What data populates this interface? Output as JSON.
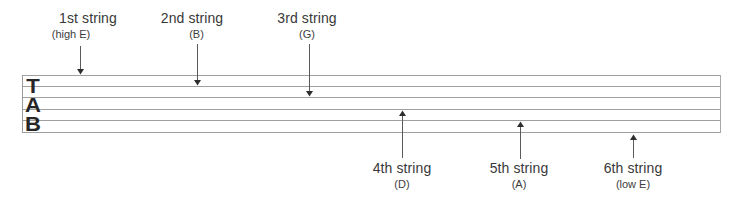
{
  "diagram": {
    "type": "guitar-tablature-string-guide",
    "clef": {
      "letters": [
        "T",
        "A",
        "B"
      ]
    },
    "colors": {
      "staff_line": "#a0a0a0",
      "text": "#383838",
      "arrow": "#3a3a3a",
      "clef": "#262626",
      "background": "#ffffff"
    },
    "strings": [
      {
        "number": 1,
        "label": "1st string",
        "note": "(high E)",
        "position": "top"
      },
      {
        "number": 2,
        "label": "2nd string",
        "note": "(B)",
        "position": "top"
      },
      {
        "number": 3,
        "label": "3rd string",
        "note": "(G)",
        "position": "top"
      },
      {
        "number": 4,
        "label": "4th string",
        "note": "(D)",
        "position": "bottom"
      },
      {
        "number": 5,
        "label": "5th string",
        "note": "(A)",
        "position": "bottom"
      },
      {
        "number": 6,
        "label": "6th string",
        "note": "(low E)",
        "position": "bottom"
      }
    ]
  }
}
